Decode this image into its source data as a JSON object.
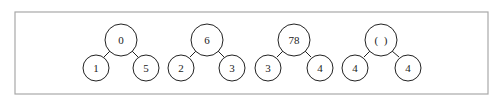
{
  "diagram": {
    "type": "binary-trees",
    "trees": [
      {
        "root": "0",
        "left": "1",
        "right": "5",
        "rx": 121,
        "lx": 96,
        "rcx": 146
      },
      {
        "root": "6",
        "left": "2",
        "right": "3",
        "rx": 207,
        "lx": 181,
        "rcx": 232
      },
      {
        "root": "78",
        "left": "3",
        "right": "4",
        "rx": 294,
        "lx": 268,
        "rcx": 320
      },
      {
        "root": "(  )",
        "left": "4",
        "right": "4",
        "rx": 381,
        "lx": 355,
        "rcx": 408
      }
    ]
  }
}
